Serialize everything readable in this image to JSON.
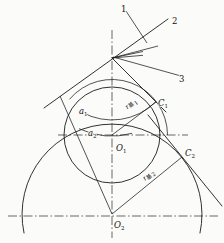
{
  "figure": {
    "background": "#fbfbf9",
    "ink_color": "#1b1b1b"
  },
  "labels": {
    "line1": "1",
    "line2": "2",
    "line3": "3",
    "a1": {
      "base": "a",
      "sub": "1"
    },
    "a2": {
      "base": "a",
      "sub": "2"
    },
    "O1": {
      "base": "O",
      "sub": "1"
    },
    "O2": {
      "base": "O",
      "sub": "2"
    },
    "C1": {
      "base": "C",
      "sub": "1"
    },
    "C2": {
      "base": "C",
      "sub": "2"
    },
    "r1": {
      "base": "r",
      "cjk": "基",
      "sub": "1"
    },
    "r2": {
      "base": "r",
      "cjk": "基",
      "sub": "2"
    }
  }
}
